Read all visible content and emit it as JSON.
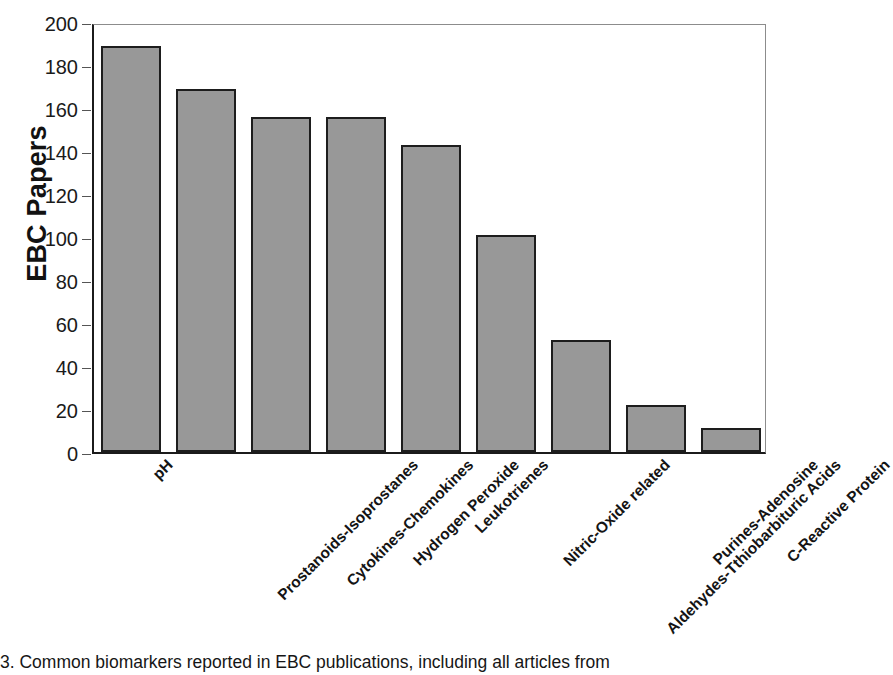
{
  "chart_data": {
    "type": "bar",
    "title": "",
    "xlabel": "",
    "ylabel": "EBC Papers",
    "ylim": [
      0,
      200
    ],
    "ytick_step": 20,
    "yticks": [
      200,
      180,
      160,
      140,
      120,
      100,
      80,
      60,
      40,
      20,
      0
    ],
    "grid": false,
    "legend": null,
    "orientation": "vertical",
    "categories": [
      "pH",
      "Prostanoids-Isoprostanes",
      "Cytokines-Chemokines",
      "Hydrogen Peroxide",
      "Leukotrienes",
      "Nitric-Oxide related",
      "Aldehydes-Tthiobarbituric Acids",
      "Purines-Adenosine",
      "C-Reactive Protein"
    ],
    "values": [
      189,
      169,
      156,
      156,
      143,
      101,
      52,
      22,
      11
    ],
    "bar_fill_color": "#989898",
    "bar_edge_color": "#1d1d1d",
    "axis_color": "#1b1b1b",
    "plot_border_color": "#8c8c8c",
    "text_color": "#141414"
  },
  "caption": {
    "text": "3. Common biomarkers reported in EBC publications, including all articles from "
  }
}
